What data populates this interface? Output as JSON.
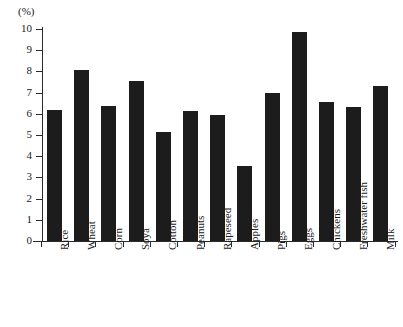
{
  "chart_data": {
    "type": "bar",
    "title": "",
    "subtitle": "",
    "xlabel": "",
    "ylabel": "(%)",
    "unit_label": "(%)",
    "ylim": [
      0,
      10
    ],
    "ytick_labels": [
      "10",
      "9",
      "8",
      "7",
      "6",
      "5",
      "4",
      "3",
      "2",
      "1",
      "0"
    ],
    "ytick_values": [
      10,
      9,
      8,
      7,
      6,
      5,
      4,
      3,
      2,
      1,
      0
    ],
    "grid": false,
    "legend": null,
    "categories": [
      "Rice",
      "Wheat",
      "Corn",
      "Soya",
      "Cotton",
      "Peanuts",
      "Rapeseed",
      "Apples",
      "Pigs",
      "Eggs",
      "Chickens",
      "Freshwater fish",
      "Milk"
    ],
    "values": [
      6.2,
      8.05,
      6.35,
      7.55,
      5.15,
      6.15,
      5.95,
      3.55,
      7.0,
      9.85,
      6.55,
      6.3,
      7.3
    ],
    "bar_color": "#1c1c1c",
    "axis_color": "#2b2b2b",
    "background_color": "#ffffff"
  }
}
